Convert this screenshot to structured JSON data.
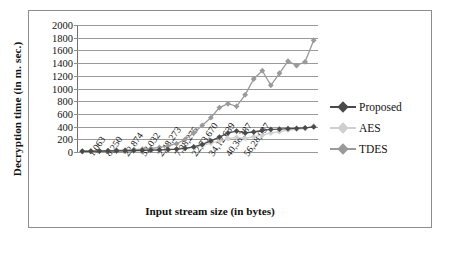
{
  "figure": {
    "ytitle": "Decryption time (in m. sec.)",
    "xtitle": "Input stream size (in bytes)"
  },
  "legend": {
    "position": "right",
    "items": [
      {
        "label": "Proposed",
        "color": "#4a4a4a"
      },
      {
        "label": "AES",
        "color": "#cfcfcf"
      },
      {
        "label": "TDES",
        "color": "#9a9a9a"
      }
    ]
  },
  "chart_data": {
    "type": "line",
    "title": "",
    "xlabel": "Input stream size (in bytes)",
    "ylabel": "Decryption time (in m. sec.)",
    "ylim": [
      0,
      2000
    ],
    "ytick_step": 200,
    "yticks": [
      0,
      200,
      400,
      600,
      800,
      1000,
      1200,
      1400,
      1600,
      1800,
      2000
    ],
    "grid": "horizontal",
    "legend_position": "right",
    "categories": [
      "1,063",
      "",
      "8,250",
      "",
      "22,874",
      "",
      "52,032",
      "",
      "2,48,273",
      "",
      "7,38,275",
      "",
      "22,73,670",
      "",
      "34,12,639",
      "",
      "40,38,387",
      "",
      "56,28,037",
      "",
      "",
      "",
      "",
      "",
      "",
      "",
      "",
      ""
    ],
    "tick_labels": [
      "1,063",
      "8,250",
      "22,874",
      "52,032",
      "2,48,273",
      "7,38,275",
      "22,73,670",
      "34,12,639",
      "40,38,387",
      "56,28,037"
    ],
    "x_index": [
      0,
      1,
      2,
      3,
      4,
      5,
      6,
      7,
      8,
      9,
      10,
      11,
      12,
      13,
      14,
      15,
      16,
      17,
      18,
      19,
      20,
      21,
      22,
      23,
      24,
      25,
      26,
      27
    ],
    "series": [
      {
        "name": "Proposed",
        "color": "#4a4a4a",
        "values": [
          10,
          12,
          14,
          16,
          18,
          20,
          22,
          25,
          28,
          32,
          38,
          46,
          58,
          80,
          120,
          175,
          235,
          300,
          330,
          300,
          315,
          340,
          355,
          360,
          368,
          372,
          380,
          395
        ]
      },
      {
        "name": "AES",
        "color": "#cfcfcf",
        "values": [
          8,
          10,
          12,
          14,
          16,
          18,
          20,
          22,
          26,
          30,
          36,
          44,
          55,
          72,
          100,
          140,
          175,
          210,
          230,
          215,
          240,
          265,
          300,
          320,
          345,
          358,
          370,
          410
        ]
      },
      {
        "name": "TDES",
        "color": "#9a9a9a",
        "values": [
          12,
          15,
          18,
          22,
          26,
          30,
          36,
          44,
          55,
          72,
          95,
          130,
          200,
          300,
          420,
          540,
          700,
          760,
          720,
          900,
          1150,
          1280,
          1050,
          1240,
          1430,
          1360,
          1420,
          1760
        ]
      }
    ]
  }
}
